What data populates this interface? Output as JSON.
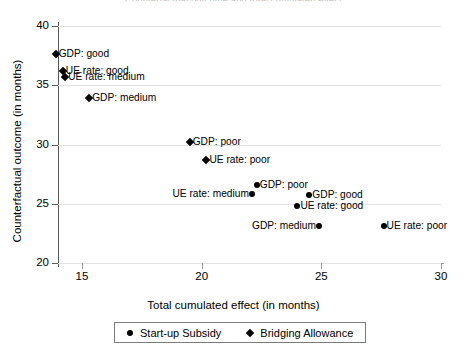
{
  "title": "Counterfactual outcome and total cumulated effect",
  "chart_data": {
    "type": "scatter",
    "title": "Counterfactual outcome and total cumulated effect",
    "xlabel": "Total cumulated effect (in months)",
    "ylabel": "Counterfactual outcome (in months)",
    "xlim": [
      13.0,
      30.2
    ],
    "ylim": [
      19.0,
      40.5
    ],
    "xticks": [
      15,
      20,
      25,
      30
    ],
    "yticks": [
      20,
      25,
      30,
      35,
      40
    ],
    "xtick_labels": [
      "15",
      "20",
      "25",
      "30"
    ],
    "ytick_labels": [
      "20",
      "25",
      "30",
      "35",
      "40"
    ],
    "grid": "horizontal",
    "legend_position": "bottom-center",
    "series": [
      {
        "name": "Start-up Subsidy",
        "marker": "circle",
        "color": "#000000",
        "points": [
          {
            "label": "GDP: poor",
            "x": 22.3,
            "y": 26.6,
            "label_side": "right"
          },
          {
            "label": "UE rate: medium",
            "x": 22.1,
            "y": 25.8,
            "label_side": "left"
          },
          {
            "label": "GDP: good",
            "x": 24.5,
            "y": 25.7,
            "label_side": "right"
          },
          {
            "label": "UE rate: good",
            "x": 24.0,
            "y": 24.8,
            "label_side": "right"
          },
          {
            "label": "GDP: medium",
            "x": 24.9,
            "y": 23.1,
            "label_side": "left"
          },
          {
            "label": "UE rate: poor",
            "x": 27.6,
            "y": 23.1,
            "label_side": "right"
          }
        ]
      },
      {
        "name": "Bridging Allowance",
        "marker": "diamond",
        "color": "#000000",
        "points": [
          {
            "label": "GDP: good",
            "x": 13.9,
            "y": 37.6,
            "label_side": "right"
          },
          {
            "label": "UE rate: good",
            "x": 14.2,
            "y": 36.2,
            "label_side": "right"
          },
          {
            "label": "UE rate: medium",
            "x": 14.3,
            "y": 35.7,
            "label_side": "right"
          },
          {
            "label": "GDP: medium",
            "x": 15.3,
            "y": 33.9,
            "label_side": "right"
          },
          {
            "label": "GDP: poor",
            "x": 19.5,
            "y": 30.2,
            "label_side": "right"
          },
          {
            "label": "UE rate: poor",
            "x": 20.2,
            "y": 28.7,
            "label_side": "right"
          }
        ]
      }
    ]
  },
  "legend": {
    "items": [
      {
        "label": "Start-up Subsidy",
        "marker": "circle"
      },
      {
        "label": "Bridging Allowance",
        "marker": "diamond"
      }
    ]
  }
}
